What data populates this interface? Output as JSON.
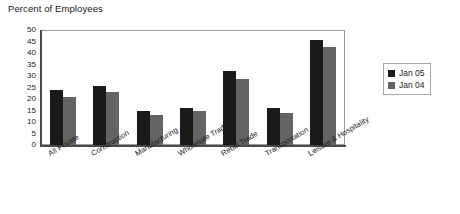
{
  "chart_data": {
    "type": "bar",
    "title": "Percent of Employees",
    "xlabel": "",
    "ylabel": "",
    "ylim": [
      0,
      50
    ],
    "ytick_step": 5,
    "yticks": [
      "50",
      "45",
      "40",
      "35",
      "30",
      "25",
      "20",
      "15",
      "10",
      "5",
      "0"
    ],
    "grid": false,
    "legend_position": "right",
    "categories": [
      "All Private",
      "Construction",
      "Manufacturing",
      "Wholesale Trade",
      "Retail Trade",
      "Transportation",
      "Leisure & Hospitality"
    ],
    "series": [
      {
        "name": "Jan 05",
        "color": "#1a1a1a",
        "values": [
          24,
          25.5,
          15,
          16,
          32,
          16,
          45.5
        ]
      },
      {
        "name": "Jan 04",
        "color": "#646464",
        "values": [
          21,
          23,
          13,
          15,
          28.5,
          14,
          42.5
        ]
      }
    ]
  },
  "legend": {
    "items": [
      {
        "label": "Jan 05",
        "color": "#1a1a1a"
      },
      {
        "label": "Jan 04",
        "color": "#646464"
      }
    ]
  }
}
